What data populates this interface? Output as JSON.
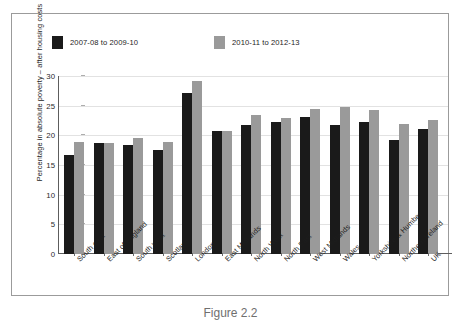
{
  "figure": {
    "caption": "Figure 2.2"
  },
  "chart_data": {
    "type": "bar",
    "title": "",
    "subtitle": "",
    "xlabel": "",
    "ylabel": "Percentage in absolute poverty – after housing costs",
    "ylim": [
      0,
      30
    ],
    "yticks": [
      0,
      5,
      10,
      15,
      20,
      25,
      30
    ],
    "ytick_labels": [
      "0",
      "5",
      "10",
      "15",
      "20",
      "25",
      "30"
    ],
    "grid": true,
    "legend_position": "top-left",
    "categories": [
      "South east",
      "East of England",
      "South west",
      "Scotland",
      "London",
      "East Midlands",
      "North West",
      "North East",
      "West Midlands",
      "Wales",
      "Yorkshire & Humber",
      "Northern Ireland",
      "UK"
    ],
    "series": [
      {
        "name": "2007-08 to 2009-10",
        "color": "#1a1a1a",
        "values": [
          16.7,
          18.7,
          18.3,
          17.6,
          27.1,
          20.7,
          21.7,
          22.2,
          23.1,
          21.8,
          22.2,
          19.2,
          21.0
        ]
      },
      {
        "name": "2010-11 to 2012-13",
        "color": "#9a9a9a",
        "values": [
          18.9,
          18.7,
          19.6,
          18.9,
          29.2,
          20.7,
          23.5,
          22.9,
          24.4,
          24.7,
          24.2,
          21.9,
          22.6
        ]
      }
    ]
  },
  "colors": {
    "series_dark": "#1a1a1a",
    "series_gray": "#9a9a9a",
    "gridline": "#e2e2e2",
    "axis": "#5d5d5d",
    "frame_border": "#9b9b9b",
    "text": "#1d1d1d",
    "background": "#ffffff"
  }
}
